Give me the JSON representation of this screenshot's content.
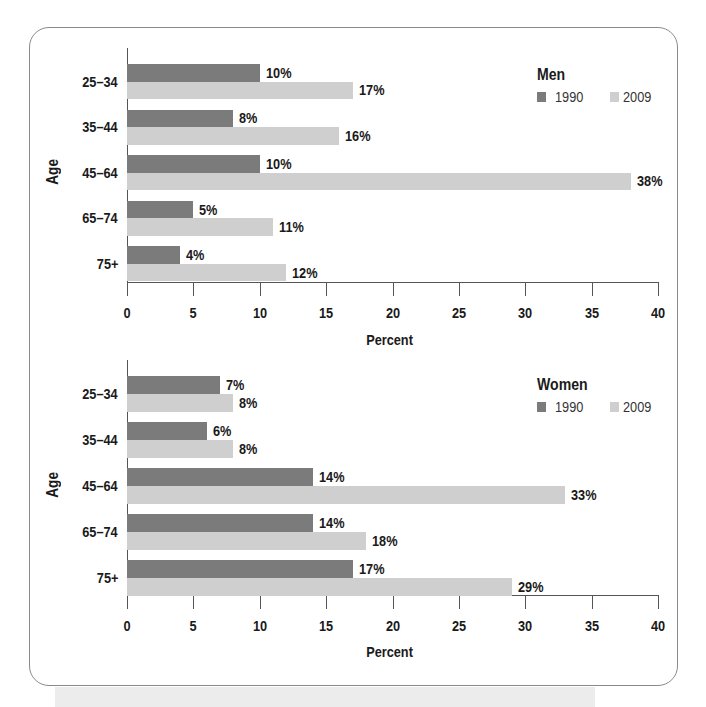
{
  "colors": {
    "series_1990": "#7b7b7b",
    "series_2009": "#cfcfcf"
  },
  "chart_data": [
    {
      "type": "bar",
      "orientation": "horizontal",
      "title": "Men",
      "xlabel": "Percent",
      "ylabel": "Age",
      "categories": [
        "25–34",
        "35–44",
        "45–64",
        "65–74",
        "75+"
      ],
      "series": [
        {
          "name": "1990",
          "values": [
            10,
            8,
            10,
            5,
            4
          ],
          "labels": [
            "10%",
            "8%",
            "10%",
            "5%",
            "4%"
          ]
        },
        {
          "name": "2009",
          "values": [
            17,
            16,
            38,
            11,
            12
          ],
          "labels": [
            "17%",
            "16%",
            "38%",
            "11%",
            "12%"
          ]
        }
      ],
      "xlim": [
        0,
        40
      ],
      "xticks": [
        "0",
        "5",
        "10",
        "15",
        "20",
        "25",
        "30",
        "35",
        "40"
      ],
      "grid": false,
      "legend_position": "top-right"
    },
    {
      "type": "bar",
      "orientation": "horizontal",
      "title": "Women",
      "xlabel": "Percent",
      "ylabel": "Age",
      "categories": [
        "25–34",
        "35–44",
        "45–64",
        "65–74",
        "75+"
      ],
      "series": [
        {
          "name": "1990",
          "values": [
            7,
            6,
            14,
            14,
            17
          ],
          "labels": [
            "7%",
            "6%",
            "14%",
            "14%",
            "17%"
          ]
        },
        {
          "name": "2009",
          "values": [
            8,
            8,
            33,
            18,
            29
          ],
          "labels": [
            "8%",
            "8%",
            "33%",
            "18%",
            "29%"
          ]
        }
      ],
      "xlim": [
        0,
        40
      ],
      "xticks": [
        "0",
        "5",
        "10",
        "15",
        "20",
        "25",
        "30",
        "35",
        "40"
      ],
      "grid": false,
      "legend_position": "top-right"
    }
  ]
}
